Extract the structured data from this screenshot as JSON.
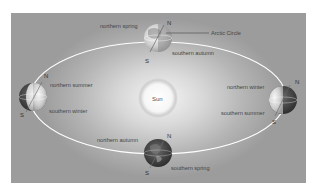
{
  "diagram": {
    "center": {
      "label": "Sun"
    },
    "positions": [
      {
        "id": "top",
        "northern": "northern spring",
        "southern": "southern autumn",
        "north_pole": "N",
        "south_pole": "S"
      },
      {
        "id": "left",
        "northern": "northern summer",
        "southern": "southern winter",
        "north_pole": "N",
        "south_pole": "S"
      },
      {
        "id": "right",
        "northern": "northern winter",
        "southern": "southern summer",
        "north_pole": "N",
        "south_pole": "S"
      },
      {
        "id": "bottom",
        "northern": "northern autumn",
        "southern": "southern spring",
        "north_pole": "N",
        "south_pole": "S"
      }
    ],
    "callout": {
      "label": "Arctic Circle"
    },
    "colors": {
      "background": "#b4b4b4",
      "orbit": "#ffffff",
      "sun": "#fafafa",
      "globe_dark": "#3a3a3a",
      "globe_light": "#e6e6e6"
    }
  }
}
